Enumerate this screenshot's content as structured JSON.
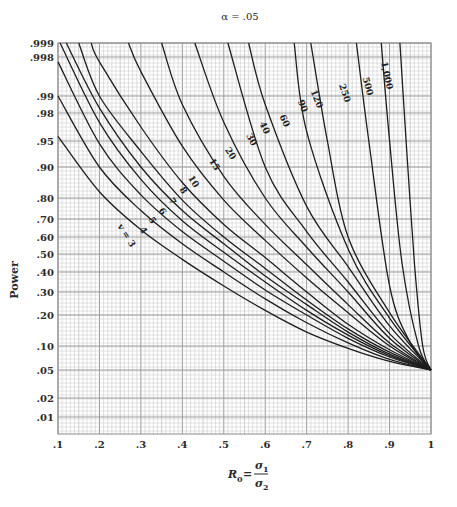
{
  "chart_data": {
    "type": "line",
    "title": "α = .05",
    "xlabel": "R0 = σ1 / σ2",
    "xlabel_parts": {
      "lhs": "R",
      "lhs_sub": "0",
      "eq": "=",
      "num": "σ",
      "num_sub": "1",
      "den": "σ",
      "den_sub": "2"
    },
    "ylabel": "Power",
    "xlim": [
      0.1,
      1.0
    ],
    "ylim": [
      0.01,
      0.999
    ],
    "x_ticks": [
      {
        "value": 0.1,
        "label": ".1"
      },
      {
        "value": 0.2,
        "label": ".2"
      },
      {
        "value": 0.3,
        "label": ".3"
      },
      {
        "value": 0.4,
        "label": ".4"
      },
      {
        "value": 0.5,
        "label": ".5"
      },
      {
        "value": 0.6,
        "label": ".6"
      },
      {
        "value": 0.7,
        "label": ".7"
      },
      {
        "value": 0.8,
        "label": ".8"
      },
      {
        "value": 0.9,
        "label": ".9"
      },
      {
        "value": 1.0,
        "label": "1"
      }
    ],
    "y_ticks": [
      {
        "value": 0.999,
        "label": ".999"
      },
      {
        "value": 0.998,
        "label": ".998"
      },
      {
        "value": 0.99,
        "label": ".99"
      },
      {
        "value": 0.98,
        "label": ".98"
      },
      {
        "value": 0.95,
        "label": ".95"
      },
      {
        "value": 0.9,
        "label": ".90"
      },
      {
        "value": 0.8,
        "label": ".80"
      },
      {
        "value": 0.7,
        "label": ".70"
      },
      {
        "value": 0.6,
        "label": ".60"
      },
      {
        "value": 0.5,
        "label": ".50"
      },
      {
        "value": 0.4,
        "label": ".40"
      },
      {
        "value": 0.3,
        "label": ".30"
      },
      {
        "value": 0.2,
        "label": ".20"
      },
      {
        "value": 0.1,
        "label": ".10"
      },
      {
        "value": 0.05,
        "label": ".05"
      },
      {
        "value": 0.02,
        "label": ".02"
      },
      {
        "value": 0.01,
        "label": ".01"
      }
    ],
    "y_scale": "normal-probability",
    "grid": true,
    "legend": "inline curve labels",
    "series": [
      {
        "name": "v = 3",
        "label": "v = 3",
        "points": [
          [
            0.1,
            0.955
          ],
          [
            0.2,
            0.82
          ],
          [
            0.3,
            0.64
          ],
          [
            0.4,
            0.47
          ],
          [
            0.5,
            0.33
          ],
          [
            0.6,
            0.22
          ],
          [
            0.7,
            0.145
          ],
          [
            0.8,
            0.095
          ],
          [
            0.9,
            0.068
          ],
          [
            1.0,
            0.05
          ]
        ]
      },
      {
        "name": "v = 4",
        "label": "4",
        "points": [
          [
            0.1,
            0.99
          ],
          [
            0.2,
            0.9
          ],
          [
            0.3,
            0.74
          ],
          [
            0.4,
            0.56
          ],
          [
            0.5,
            0.4
          ],
          [
            0.6,
            0.27
          ],
          [
            0.7,
            0.175
          ],
          [
            0.8,
            0.11
          ],
          [
            0.9,
            0.072
          ],
          [
            1.0,
            0.05
          ]
        ]
      },
      {
        "name": "v = 5",
        "label": "5",
        "points": [
          [
            0.1,
            0.997
          ],
          [
            0.2,
            0.945
          ],
          [
            0.3,
            0.81
          ],
          [
            0.4,
            0.63
          ],
          [
            0.5,
            0.46
          ],
          [
            0.6,
            0.31
          ],
          [
            0.7,
            0.2
          ],
          [
            0.8,
            0.125
          ],
          [
            0.9,
            0.077
          ],
          [
            1.0,
            0.05
          ]
        ]
      },
      {
        "name": "v = 6",
        "label": "6",
        "points": [
          [
            0.105,
            0.999
          ],
          [
            0.2,
            0.97
          ],
          [
            0.3,
            0.86
          ],
          [
            0.4,
            0.69
          ],
          [
            0.5,
            0.51
          ],
          [
            0.6,
            0.35
          ],
          [
            0.7,
            0.22
          ],
          [
            0.8,
            0.135
          ],
          [
            0.9,
            0.08
          ],
          [
            1.0,
            0.05
          ]
        ]
      },
      {
        "name": "v = 7",
        "label": "7",
        "points": [
          [
            0.12,
            0.999
          ],
          [
            0.2,
            0.983
          ],
          [
            0.3,
            0.9
          ],
          [
            0.4,
            0.74
          ],
          [
            0.5,
            0.56
          ],
          [
            0.6,
            0.38
          ],
          [
            0.7,
            0.245
          ],
          [
            0.8,
            0.145
          ],
          [
            0.9,
            0.083
          ],
          [
            1.0,
            0.05
          ]
        ]
      },
      {
        "name": "v = 8",
        "label": "8",
        "points": [
          [
            0.15,
            0.999
          ],
          [
            0.2,
            0.99
          ],
          [
            0.3,
            0.93
          ],
          [
            0.4,
            0.79
          ],
          [
            0.5,
            0.6
          ],
          [
            0.6,
            0.42
          ],
          [
            0.7,
            0.265
          ],
          [
            0.8,
            0.155
          ],
          [
            0.9,
            0.087
          ],
          [
            1.0,
            0.05
          ]
        ]
      },
      {
        "name": "v = 10",
        "label": "10",
        "points": [
          [
            0.18,
            0.999
          ],
          [
            0.2,
            0.997
          ],
          [
            0.3,
            0.965
          ],
          [
            0.4,
            0.85
          ],
          [
            0.5,
            0.67
          ],
          [
            0.6,
            0.48
          ],
          [
            0.7,
            0.3
          ],
          [
            0.8,
            0.17
          ],
          [
            0.9,
            0.092
          ],
          [
            1.0,
            0.05
          ]
        ]
      },
      {
        "name": "v = 15",
        "label": "15",
        "points": [
          [
            0.27,
            0.999
          ],
          [
            0.3,
            0.995
          ],
          [
            0.4,
            0.94
          ],
          [
            0.5,
            0.79
          ],
          [
            0.6,
            0.58
          ],
          [
            0.7,
            0.37
          ],
          [
            0.8,
            0.21
          ],
          [
            0.9,
            0.1
          ],
          [
            1.0,
            0.05
          ]
        ]
      },
      {
        "name": "v = 20",
        "label": "20",
        "points": [
          [
            0.35,
            0.999
          ],
          [
            0.4,
            0.985
          ],
          [
            0.5,
            0.87
          ],
          [
            0.6,
            0.67
          ],
          [
            0.7,
            0.44
          ],
          [
            0.8,
            0.245
          ],
          [
            0.9,
            0.11
          ],
          [
            1.0,
            0.05
          ]
        ]
      },
      {
        "name": "v = 30",
        "label": "30",
        "points": [
          [
            0.43,
            0.999
          ],
          [
            0.5,
            0.97
          ],
          [
            0.6,
            0.8
          ],
          [
            0.7,
            0.54
          ],
          [
            0.8,
            0.3
          ],
          [
            0.9,
            0.125
          ],
          [
            1.0,
            0.05
          ]
        ]
      },
      {
        "name": "v = 40",
        "label": "40",
        "points": [
          [
            0.51,
            0.999
          ],
          [
            0.6,
            0.9
          ],
          [
            0.7,
            0.63
          ],
          [
            0.8,
            0.35
          ],
          [
            0.9,
            0.14
          ],
          [
            1.0,
            0.05
          ]
        ]
      },
      {
        "name": "v = 60",
        "label": "60",
        "points": [
          [
            0.56,
            0.999
          ],
          [
            0.6,
            0.985
          ],
          [
            0.7,
            0.76
          ],
          [
            0.8,
            0.43
          ],
          [
            0.9,
            0.165
          ],
          [
            1.0,
            0.05
          ]
        ]
      },
      {
        "name": "v = 90",
        "label": "90",
        "points": [
          [
            0.67,
            0.999
          ],
          [
            0.7,
            0.96
          ],
          [
            0.8,
            0.53
          ],
          [
            0.9,
            0.19
          ],
          [
            1.0,
            0.05
          ]
        ]
      },
      {
        "name": "v = 120",
        "label": "120",
        "points": [
          [
            0.71,
            0.999
          ],
          [
            0.75,
            0.95
          ],
          [
            0.8,
            0.6
          ],
          [
            0.9,
            0.21
          ],
          [
            1.0,
            0.05
          ]
        ]
      },
      {
        "name": "v = 250",
        "label": "250",
        "points": [
          [
            0.82,
            0.999
          ],
          [
            0.85,
            0.95
          ],
          [
            0.9,
            0.33
          ],
          [
            0.95,
            0.11
          ],
          [
            1.0,
            0.05
          ]
        ]
      },
      {
        "name": "v = 500",
        "label": "500",
        "points": [
          [
            0.88,
            0.999
          ],
          [
            0.9,
            0.95
          ],
          [
            0.93,
            0.45
          ],
          [
            0.97,
            0.1
          ],
          [
            1.0,
            0.05
          ]
        ]
      },
      {
        "name": "v = 1,000",
        "label": "1,000",
        "points": [
          [
            0.925,
            0.999
          ],
          [
            0.94,
            0.95
          ],
          [
            0.96,
            0.45
          ],
          [
            0.98,
            0.1
          ],
          [
            1.0,
            0.05
          ]
        ]
      }
    ]
  },
  "colors": {
    "curve": "#1e1e1e",
    "grid_minor": "#c4c4c4",
    "grid_major": "#9a9a9a",
    "frame": "#8a8a8a",
    "text": "#2a2a2a"
  },
  "layout": {
    "plot": {
      "left": 58,
      "right": 431,
      "top": 43,
      "bottom": 434
    },
    "y_pixel_map": [
      [
        0.999,
        43
      ],
      [
        0.998,
        57
      ],
      [
        0.99,
        96
      ],
      [
        0.98,
        113
      ],
      [
        0.95,
        141
      ],
      [
        0.9,
        167
      ],
      [
        0.8,
        198
      ],
      [
        0.7,
        219
      ],
      [
        0.6,
        237
      ],
      [
        0.5,
        254
      ],
      [
        0.4,
        272
      ],
      [
        0.3,
        292
      ],
      [
        0.2,
        315
      ],
      [
        0.1,
        346
      ],
      [
        0.05,
        370
      ],
      [
        0.02,
        398
      ],
      [
        0.01,
        417
      ],
      [
        0.005,
        434
      ]
    ],
    "label_positions": [
      {
        "series": 0,
        "x": 124,
        "y": 237,
        "rot": 58
      },
      {
        "series": 1,
        "x": 141,
        "y": 232,
        "rot": 58
      },
      {
        "series": 2,
        "x": 150,
        "y": 222,
        "rot": 58
      },
      {
        "series": 3,
        "x": 160,
        "y": 213,
        "rot": 58
      },
      {
        "series": 4,
        "x": 170,
        "y": 203,
        "rot": 58
      },
      {
        "series": 5,
        "x": 181,
        "y": 192,
        "rot": 58
      },
      {
        "series": 6,
        "x": 191,
        "y": 183,
        "rot": 58
      },
      {
        "series": 7,
        "x": 212,
        "y": 166,
        "rot": 58
      },
      {
        "series": 8,
        "x": 228,
        "y": 155,
        "rot": 58
      },
      {
        "series": 9,
        "x": 249,
        "y": 141,
        "rot": 62
      },
      {
        "series": 10,
        "x": 262,
        "y": 129,
        "rot": 65
      },
      {
        "series": 11,
        "x": 282,
        "y": 122,
        "rot": 65
      },
      {
        "series": 12,
        "x": 300,
        "y": 107,
        "rot": 68
      },
      {
        "series": 13,
        "x": 314,
        "y": 100,
        "rot": 68
      },
      {
        "series": 14,
        "x": 342,
        "y": 94,
        "rot": 72
      },
      {
        "series": 15,
        "x": 365,
        "y": 87,
        "rot": 75
      },
      {
        "series": 16,
        "x": 384,
        "y": 76,
        "rot": 78
      }
    ]
  }
}
